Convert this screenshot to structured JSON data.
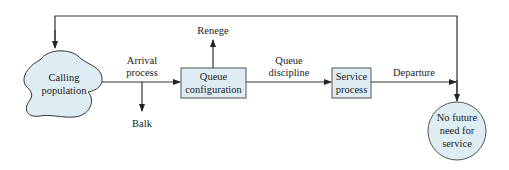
{
  "diagram": {
    "type": "flowchart",
    "title": "",
    "colors": {
      "node_fill": "#deecf4",
      "node_stroke": "#555555",
      "line": "#222222"
    },
    "nodes": {
      "calling_population": {
        "line1": "Calling",
        "line2": "population"
      },
      "queue_configuration": {
        "line1": "Queue",
        "line2": "configuration"
      },
      "service_process": {
        "line1": "Service",
        "line2": "process"
      },
      "no_future_need": {
        "line1": "No future",
        "line2": "need for",
        "line3": "service"
      }
    },
    "edge_labels": {
      "arrival_process": {
        "line1": "Arrival",
        "line2": "process"
      },
      "queue_discipline": {
        "line1": "Queue",
        "line2": "discipline"
      },
      "departure": "Departure",
      "renege": "Renege",
      "balk": "Balk"
    },
    "edges": [
      {
        "from": "calling_population",
        "to": "queue_configuration",
        "label": "Arrival process"
      },
      {
        "from": "arrival_process",
        "to": "balk",
        "label": "Balk"
      },
      {
        "from": "queue_configuration",
        "to": "renege",
        "label": "Renege"
      },
      {
        "from": "queue_configuration",
        "to": "service_process",
        "label": "Queue discipline"
      },
      {
        "from": "service_process",
        "to": "main_exit",
        "label": "Departure"
      },
      {
        "from": "feedback",
        "to": "calling_population",
        "label": ""
      },
      {
        "from": "feedback",
        "to": "no_future_need",
        "label": ""
      }
    ]
  }
}
